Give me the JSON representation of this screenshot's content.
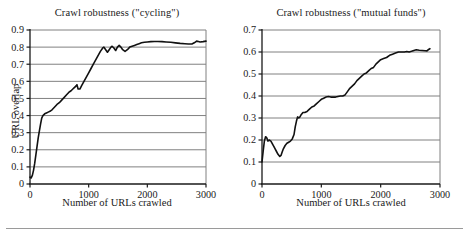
{
  "figure": {
    "background": "#ffffff",
    "axis_color": "#1a1a1a",
    "grid_color": "#808080",
    "curve_color": "#111111",
    "rule_color": "#9a9a9a"
  },
  "chart_data": [
    {
      "type": "line",
      "title": "Crawl robustness (\"cycling\")",
      "xlabel": "Number of URLs crawled",
      "ylabel": "URL overlap",
      "xlim": [
        0,
        3000
      ],
      "ylim": [
        0,
        0.9
      ],
      "grid": true,
      "grid_axis": "y",
      "legend": "none",
      "xticks": [
        0,
        1000,
        2000,
        3000
      ],
      "xticklabels": [
        "0",
        "1000",
        "2000",
        "3000"
      ],
      "yticks": [
        0,
        0.1,
        0.2,
        0.3,
        0.4,
        0.5,
        0.6,
        0.7,
        0.8,
        0.9
      ],
      "yticklabels": [
        "0",
        "0.1",
        "0.2",
        "0.3",
        "0.4",
        "0.5",
        "0.6",
        "0.7",
        "0.8",
        "0.9"
      ],
      "series": [
        {
          "name": "cycling",
          "x": [
            0,
            20,
            40,
            60,
            80,
            100,
            120,
            140,
            160,
            180,
            200,
            220,
            250,
            280,
            310,
            340,
            380,
            420,
            460,
            500,
            540,
            580,
            620,
            660,
            700,
            730,
            760,
            790,
            800,
            820,
            850,
            880,
            920,
            960,
            1000,
            1040,
            1080,
            1120,
            1160,
            1200,
            1240,
            1260,
            1290,
            1320,
            1350,
            1380,
            1400,
            1430,
            1460,
            1490,
            1520,
            1550,
            1580,
            1620,
            1660,
            1700,
            1740,
            1780,
            1820,
            1860,
            1900,
            1950,
            2000,
            2060,
            2120,
            2180,
            2250,
            2320,
            2400,
            2480,
            2560,
            2640,
            2700,
            2760,
            2800,
            2840,
            2870,
            2900,
            2950,
            3000
          ],
          "y": [
            0.04,
            0.035,
            0.05,
            0.08,
            0.12,
            0.17,
            0.22,
            0.27,
            0.31,
            0.35,
            0.385,
            0.4,
            0.41,
            0.415,
            0.42,
            0.425,
            0.435,
            0.45,
            0.465,
            0.475,
            0.49,
            0.505,
            0.52,
            0.535,
            0.545,
            0.555,
            0.565,
            0.575,
            0.58,
            0.555,
            0.555,
            0.575,
            0.6,
            0.625,
            0.65,
            0.675,
            0.7,
            0.725,
            0.75,
            0.775,
            0.795,
            0.8,
            0.785,
            0.77,
            0.785,
            0.8,
            0.805,
            0.795,
            0.78,
            0.8,
            0.81,
            0.8,
            0.785,
            0.775,
            0.785,
            0.8,
            0.805,
            0.81,
            0.815,
            0.82,
            0.825,
            0.828,
            0.83,
            0.832,
            0.833,
            0.833,
            0.832,
            0.83,
            0.828,
            0.825,
            0.822,
            0.82,
            0.818,
            0.818,
            0.825,
            0.835,
            0.833,
            0.83,
            0.832,
            0.835
          ]
        }
      ]
    },
    {
      "type": "line",
      "title": "Crawl robustness (\"mutual funds\")",
      "xlabel": "Number of URLs crawled",
      "ylabel": "",
      "xlim": [
        0,
        3000
      ],
      "ylim": [
        0,
        0.7
      ],
      "grid": true,
      "grid_axis": "y",
      "legend": "none",
      "xticks": [
        0,
        1000,
        2000,
        3000
      ],
      "xticklabels": [
        "0",
        "1000",
        "2000",
        "3000"
      ],
      "yticks": [
        0,
        0.1,
        0.2,
        0.3,
        0.4,
        0.5,
        0.6,
        0.7
      ],
      "yticklabels": [
        "0",
        "0.1",
        "0.2",
        "0.3",
        "0.4",
        "0.5",
        "0.6",
        "0.7"
      ],
      "series": [
        {
          "name": "mutual funds",
          "x": [
            0,
            20,
            40,
            60,
            80,
            100,
            120,
            150,
            180,
            210,
            240,
            270,
            300,
            320,
            340,
            360,
            390,
            420,
            450,
            480,
            510,
            540,
            560,
            580,
            600,
            620,
            640,
            660,
            690,
            720,
            760,
            800,
            840,
            880,
            920,
            960,
            1000,
            1040,
            1080,
            1120,
            1160,
            1200,
            1240,
            1280,
            1320,
            1360,
            1400,
            1440,
            1480,
            1520,
            1560,
            1600,
            1640,
            1680,
            1720,
            1760,
            1800,
            1840,
            1880,
            1920,
            1960,
            2000,
            2050,
            2100,
            2150,
            2200,
            2250,
            2300,
            2350,
            2400,
            2440,
            2480,
            2520,
            2560,
            2600,
            2650,
            2700,
            2750,
            2780,
            2800,
            2830
          ],
          "y": [
            0.1,
            0.15,
            0.195,
            0.215,
            0.21,
            0.195,
            0.2,
            0.195,
            0.18,
            0.165,
            0.15,
            0.135,
            0.125,
            0.13,
            0.145,
            0.16,
            0.175,
            0.185,
            0.19,
            0.195,
            0.205,
            0.225,
            0.26,
            0.285,
            0.305,
            0.3,
            0.305,
            0.315,
            0.325,
            0.325,
            0.33,
            0.34,
            0.35,
            0.355,
            0.365,
            0.375,
            0.385,
            0.39,
            0.395,
            0.398,
            0.395,
            0.395,
            0.395,
            0.398,
            0.4,
            0.4,
            0.405,
            0.42,
            0.435,
            0.445,
            0.455,
            0.47,
            0.48,
            0.49,
            0.5,
            0.505,
            0.515,
            0.525,
            0.53,
            0.545,
            0.555,
            0.565,
            0.57,
            0.575,
            0.585,
            0.59,
            0.595,
            0.6,
            0.6,
            0.6,
            0.602,
            0.6,
            0.603,
            0.607,
            0.61,
            0.608,
            0.607,
            0.606,
            0.605,
            0.61,
            0.615
          ]
        }
      ]
    }
  ]
}
